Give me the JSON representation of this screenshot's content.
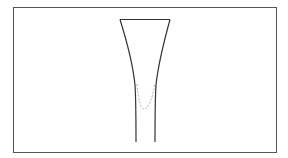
{
  "diagram": {
    "type": "tube-cross-section",
    "frame": {
      "x": 13,
      "y": 7,
      "width": 263,
      "height": 145,
      "stroke": "#555555"
    },
    "tube": {
      "stroke": "#333333",
      "top_rim": {
        "x1": 120,
        "x2": 170,
        "y": 19
      },
      "left_wall": {
        "top": [
          120,
          19
        ],
        "bottom": [
          136,
          142
        ]
      },
      "right_wall": {
        "top": [
          170,
          19
        ],
        "bottom": [
          155,
          142
        ]
      }
    },
    "meniscus": {
      "style": "dashed",
      "stroke": "#b0b0b0",
      "left": [
        136,
        85
      ],
      "bottom": [
        144,
        109
      ],
      "right": [
        156,
        85
      ]
    }
  }
}
